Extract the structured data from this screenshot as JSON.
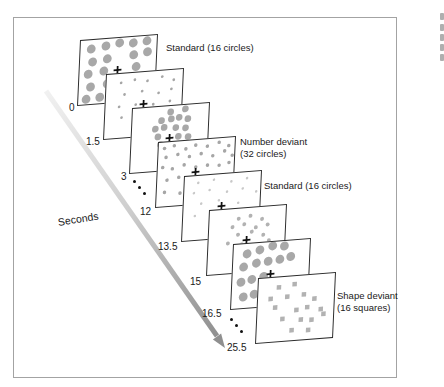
{
  "timeline": {
    "label": "Seconds",
    "label_x": 57,
    "label_y": 216,
    "arrow": {
      "x1": 46,
      "y1": 91,
      "x2": 217,
      "y2": 336,
      "tip": [
        225,
        348
      ],
      "head": [
        [
          225,
          348
        ],
        [
          212.9,
          339.4
        ],
        [
          221.1,
          333.6
        ]
      ],
      "color_start": "#f1f1f1",
      "color_mid": "#cfcfcf",
      "color_end": "#8a8a8a",
      "head_color": "#8f8f8f",
      "width": 5
    },
    "ellipses": [
      {
        "dots": [
          [
            133,
            180
          ],
          [
            138,
            186
          ],
          [
            143,
            192
          ]
        ]
      },
      {
        "dots": [
          [
            230,
            318
          ],
          [
            235,
            324
          ],
          [
            240,
            330
          ]
        ]
      }
    ]
  },
  "frame": {
    "x": 13,
    "y": 17,
    "w": 384,
    "h": 361
  },
  "panels": [
    {
      "id": "standard-large",
      "time": "0",
      "tick_x": 69,
      "tick_y": 102,
      "x": 80,
      "y": 40,
      "z": 10,
      "shape": "circle",
      "dot_r": 4.5,
      "dot_color": "#a8a8a8",
      "has_cross": true,
      "count": 16,
      "label_lines": [
        "Standard (16 circles)"
      ],
      "label_x": 166,
      "label_y": 42,
      "dots": [
        [
          11,
          9
        ],
        [
          26,
          7
        ],
        [
          40,
          5
        ],
        [
          54,
          6
        ],
        [
          68,
          5
        ],
        [
          13,
          22
        ],
        [
          28,
          20
        ],
        [
          55,
          18
        ],
        [
          69,
          16
        ],
        [
          9,
          34
        ],
        [
          25,
          32
        ],
        [
          58,
          30
        ],
        [
          12,
          47
        ],
        [
          29,
          45
        ],
        [
          8,
          59
        ],
        [
          22,
          58
        ]
      ]
    },
    {
      "id": "standard-small",
      "time": "1.5",
      "tick_x": 86,
      "tick_y": 136,
      "x": 106,
      "y": 74,
      "z": 11,
      "shape": "circle",
      "dot_r": 1.4,
      "dot_color": "#a6a6a6",
      "has_cross": true,
      "count": 16,
      "label_lines": [],
      "label_x": 0,
      "label_y": 0,
      "dots": [
        [
          15,
          9
        ],
        [
          29,
          7
        ],
        [
          42,
          9
        ],
        [
          57,
          6
        ],
        [
          69,
          10
        ],
        [
          19,
          21
        ],
        [
          37,
          19
        ],
        [
          54,
          22
        ],
        [
          67,
          19
        ],
        [
          14,
          33
        ],
        [
          31,
          32
        ],
        [
          49,
          33
        ],
        [
          66,
          31
        ],
        [
          17,
          44
        ],
        [
          36,
          46
        ],
        [
          56,
          44
        ]
      ]
    },
    {
      "id": "standard-medium",
      "time": "3",
      "tick_x": 121,
      "tick_y": 171,
      "x": 132,
      "y": 108,
      "z": 12,
      "shape": "circle",
      "dot_r": 3.4,
      "dot_color": "#a8a8a8",
      "has_cross": true,
      "count": 16,
      "label_lines": [],
      "label_x": 0,
      "label_y": 0,
      "dots": [
        [
          39,
          6
        ],
        [
          54,
          4
        ],
        [
          30,
          14
        ],
        [
          40,
          13
        ],
        [
          48,
          12
        ],
        [
          57,
          14
        ],
        [
          24,
          22
        ],
        [
          33,
          21
        ],
        [
          45,
          22
        ],
        [
          55,
          23
        ],
        [
          27,
          30
        ],
        [
          48,
          31
        ],
        [
          58,
          32
        ],
        [
          30,
          38
        ],
        [
          44,
          40
        ],
        [
          56,
          42
        ]
      ]
    },
    {
      "id": "number-deviant",
      "time": "12",
      "tick_x": 140,
      "tick_y": 206,
      "x": 158,
      "y": 142,
      "z": 13,
      "shape": "circle",
      "dot_r": 1.8,
      "dot_color": "#a6a6a6",
      "has_cross": true,
      "count": 32,
      "label_lines": [
        "Number deviant",
        "(32 circles)"
      ],
      "label_x": 240,
      "label_y": 136,
      "dots": [
        [
          6,
          6
        ],
        [
          16,
          4
        ],
        [
          28,
          8
        ],
        [
          38,
          5
        ],
        [
          50,
          7
        ],
        [
          62,
          4
        ],
        [
          72,
          8
        ],
        [
          8,
          15
        ],
        [
          20,
          13
        ],
        [
          32,
          16
        ],
        [
          44,
          14
        ],
        [
          56,
          17
        ],
        [
          68,
          13
        ],
        [
          76,
          18
        ],
        [
          5,
          25
        ],
        [
          15,
          27
        ],
        [
          27,
          24
        ],
        [
          39,
          27
        ],
        [
          51,
          26
        ],
        [
          63,
          27
        ],
        [
          73,
          25
        ],
        [
          10,
          38
        ],
        [
          22,
          36
        ],
        [
          34,
          40
        ],
        [
          47,
          38
        ],
        [
          58,
          41
        ],
        [
          70,
          37
        ],
        [
          8,
          50
        ],
        [
          24,
          52
        ],
        [
          42,
          50
        ],
        [
          60,
          52
        ],
        [
          74,
          48
        ]
      ]
    },
    {
      "id": "standard-faint",
      "time": "13.5",
      "tick_x": 158,
      "tick_y": 241,
      "x": 184,
      "y": 176,
      "z": 14,
      "shape": "circle",
      "dot_r": 1.3,
      "dot_color": "#c8c8c8",
      "has_cross": true,
      "count": 16,
      "label_lines": [
        "Standard (16 circles)"
      ],
      "label_x": 264,
      "label_y": 180,
      "dots": [
        [
          14,
          7
        ],
        [
          30,
          5
        ],
        [
          48,
          8
        ],
        [
          64,
          6
        ],
        [
          10,
          17
        ],
        [
          26,
          15
        ],
        [
          44,
          18
        ],
        [
          60,
          16
        ],
        [
          74,
          20
        ],
        [
          18,
          28
        ],
        [
          36,
          26
        ],
        [
          56,
          30
        ],
        [
          12,
          40
        ],
        [
          32,
          42
        ],
        [
          52,
          44
        ],
        [
          68,
          40
        ]
      ]
    },
    {
      "id": "standard-cluster",
      "time": "15",
      "tick_x": 190,
      "tick_y": 276,
      "x": 209,
      "y": 210,
      "z": 15,
      "shape": "circle",
      "dot_r": 2,
      "dot_color": "#b2b2b2",
      "has_cross": true,
      "count": 16,
      "label_lines": [],
      "label_x": 0,
      "label_y": 0,
      "dots": [
        [
          30,
          10
        ],
        [
          42,
          8
        ],
        [
          54,
          12
        ],
        [
          24,
          18
        ],
        [
          36,
          16
        ],
        [
          48,
          20
        ],
        [
          60,
          18
        ],
        [
          30,
          26
        ],
        [
          44,
          24
        ],
        [
          56,
          28
        ],
        [
          20,
          34
        ],
        [
          34,
          36
        ],
        [
          48,
          38
        ],
        [
          62,
          34
        ],
        [
          28,
          46
        ],
        [
          44,
          48
        ]
      ]
    },
    {
      "id": "standard-large-2",
      "time": "16.5",
      "tick_x": 202,
      "tick_y": 308,
      "x": 233,
      "y": 244,
      "z": 16,
      "shape": "circle",
      "dot_r": 4.5,
      "dot_color": "#a8a8a8",
      "has_cross": true,
      "count": 16,
      "label_lines": [],
      "label_x": 0,
      "label_y": 0,
      "dots": [
        [
          14,
          10
        ],
        [
          27,
          7
        ],
        [
          40,
          4
        ],
        [
          52,
          5
        ],
        [
          11,
          23
        ],
        [
          24,
          20
        ],
        [
          36,
          19
        ],
        [
          48,
          18
        ],
        [
          59,
          16
        ],
        [
          9,
          38
        ],
        [
          20,
          36
        ],
        [
          32,
          34
        ],
        [
          12,
          53
        ],
        [
          23,
          51
        ],
        [
          35,
          50
        ],
        [
          47,
          52
        ]
      ]
    },
    {
      "id": "shape-deviant",
      "time": "25.5",
      "tick_x": 227,
      "tick_y": 342,
      "x": 258,
      "y": 278,
      "z": 17,
      "shape": "square",
      "dot_r": 2.3,
      "dot_color": "#b2b2b2",
      "has_cross": false,
      "count": 16,
      "label_lines": [
        "Shape deviant",
        "(16 squares)"
      ],
      "label_x": 337,
      "label_y": 290,
      "dots": [
        [
          21,
          10
        ],
        [
          37,
          8
        ],
        [
          13,
          21
        ],
        [
          30,
          20
        ],
        [
          47,
          19
        ],
        [
          58,
          24
        ],
        [
          18,
          30
        ],
        [
          40,
          34
        ],
        [
          51,
          32
        ],
        [
          65,
          35
        ],
        [
          26,
          42
        ],
        [
          45,
          44
        ],
        [
          56,
          45
        ],
        [
          68,
          40
        ],
        [
          36,
          54
        ],
        [
          53,
          55
        ]
      ]
    }
  ],
  "edge_fragments": [
    [
      440,
      13
    ],
    [
      440,
      24
    ],
    [
      440,
      34
    ],
    [
      440,
      44
    ],
    [
      440,
      54
    ]
  ]
}
